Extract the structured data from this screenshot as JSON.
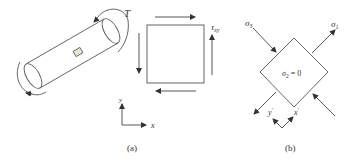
{
  "figure": {
    "panel_a": {
      "caption": "(a)",
      "torque_label": "T",
      "shear_label_main": "τ",
      "shear_label_sub": "xy",
      "axis_y": "y",
      "axis_x": "x"
    },
    "panel_b": {
      "caption": "(b)",
      "sigma3_main": "σ",
      "sigma3_sub": "3",
      "sigma1_main": "σ",
      "sigma1_sub": "1",
      "sigma2_text": "σ",
      "sigma2_sub": "2",
      "sigma2_eq": " = 0",
      "axis_yp": "y",
      "axis_xp": "x",
      "prime": "′"
    }
  },
  "colors": {
    "line": "#555555",
    "element_fill": "#e8e8c8"
  }
}
